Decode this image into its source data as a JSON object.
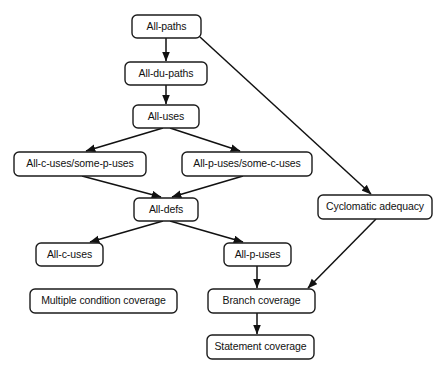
{
  "diagram": {
    "type": "flowchart",
    "canvas": {
      "width": 446,
      "height": 371
    },
    "style": {
      "background_color": "#ffffff",
      "node_fill": "#ffffff",
      "node_stroke": "#1b1b1b",
      "edge_color": "#111111",
      "text_color": "#111111",
      "corner_radius": 5
    },
    "nodes": [
      {
        "id": "all-paths",
        "label": "All-paths",
        "x": 132,
        "y": 15,
        "w": 69,
        "h": 23
      },
      {
        "id": "all-du-paths",
        "label": "All-du-paths",
        "x": 125,
        "y": 62,
        "w": 82,
        "h": 23
      },
      {
        "id": "all-uses",
        "label": "All-uses",
        "x": 133,
        "y": 105,
        "w": 66,
        "h": 23
      },
      {
        "id": "all-c-some-p",
        "label": "All-c-uses/some-p-uses",
        "x": 14,
        "y": 152,
        "w": 132,
        "h": 24
      },
      {
        "id": "all-p-some-c",
        "label": "All-p-uses/some-c-uses",
        "x": 182,
        "y": 152,
        "w": 130,
        "h": 24
      },
      {
        "id": "cyclomatic",
        "label": "Cyclomatic adequacy",
        "x": 318,
        "y": 195,
        "w": 114,
        "h": 24
      },
      {
        "id": "all-defs",
        "label": "All-defs",
        "x": 134,
        "y": 198,
        "w": 64,
        "h": 23
      },
      {
        "id": "all-c-uses",
        "label": "All-c-uses",
        "x": 36,
        "y": 243,
        "w": 67,
        "h": 23
      },
      {
        "id": "all-p-uses",
        "label": "All-p-uses",
        "x": 224,
        "y": 243,
        "w": 67,
        "h": 23
      },
      {
        "id": "multiple-cond",
        "label": "Multiple condition coverage",
        "x": 30,
        "y": 289,
        "w": 147,
        "h": 24
      },
      {
        "id": "branch-coverage",
        "label": "Branch coverage",
        "x": 208,
        "y": 289,
        "w": 107,
        "h": 24
      },
      {
        "id": "statement-cov",
        "label": "Statement coverage",
        "x": 207,
        "y": 335,
        "w": 107,
        "h": 24
      }
    ],
    "edges": [
      {
        "id": "e1",
        "from": "all-paths",
        "to": "all-du-paths",
        "x1": 166,
        "y1": 38,
        "x2": 166,
        "y2": 61,
        "arrow": true
      },
      {
        "id": "e2",
        "from": "all-du-paths",
        "to": "all-uses",
        "x1": 166,
        "y1": 85,
        "x2": 166,
        "y2": 104,
        "arrow": true
      },
      {
        "id": "e3",
        "from": "all-uses",
        "to": "all-c-some-p",
        "x1": 163,
        "y1": 128,
        "x2": 86,
        "y2": 151,
        "arrow": true
      },
      {
        "id": "e4",
        "from": "all-uses",
        "to": "all-p-some-c",
        "x1": 170,
        "y1": 128,
        "x2": 240,
        "y2": 151,
        "arrow": true
      },
      {
        "id": "e5",
        "from": "all-c-some-p",
        "to": "all-defs",
        "x1": 82,
        "y1": 176,
        "x2": 161,
        "y2": 197,
        "arrow": true
      },
      {
        "id": "e6",
        "from": "all-p-some-c",
        "to": "all-defs",
        "x1": 243,
        "y1": 176,
        "x2": 172,
        "y2": 197,
        "arrow": true
      },
      {
        "id": "e7",
        "from": "all-defs",
        "to": "all-c-uses",
        "x1": 163,
        "y1": 221,
        "x2": 90,
        "y2": 242,
        "arrow": true
      },
      {
        "id": "e8",
        "from": "all-defs",
        "to": "all-p-uses",
        "x1": 170,
        "y1": 221,
        "x2": 243,
        "y2": 242,
        "arrow": true
      },
      {
        "id": "e9",
        "from": "all-p-uses",
        "to": "branch-coverage",
        "x1": 257,
        "y1": 266,
        "x2": 257,
        "y2": 288,
        "arrow": true
      },
      {
        "id": "e10",
        "from": "branch-coverage",
        "to": "statement-cov",
        "x1": 257,
        "y1": 313,
        "x2": 257,
        "y2": 334,
        "arrow": true
      },
      {
        "id": "e11",
        "from": "all-paths",
        "to": "cyclomatic",
        "x1": 200,
        "y1": 37,
        "x2": 371,
        "y2": 194,
        "arrow": true
      },
      {
        "id": "e12",
        "from": "cyclomatic",
        "to": "branch-coverage",
        "x1": 376,
        "y1": 219,
        "x2": 308,
        "y2": 288,
        "arrow": true
      }
    ]
  }
}
